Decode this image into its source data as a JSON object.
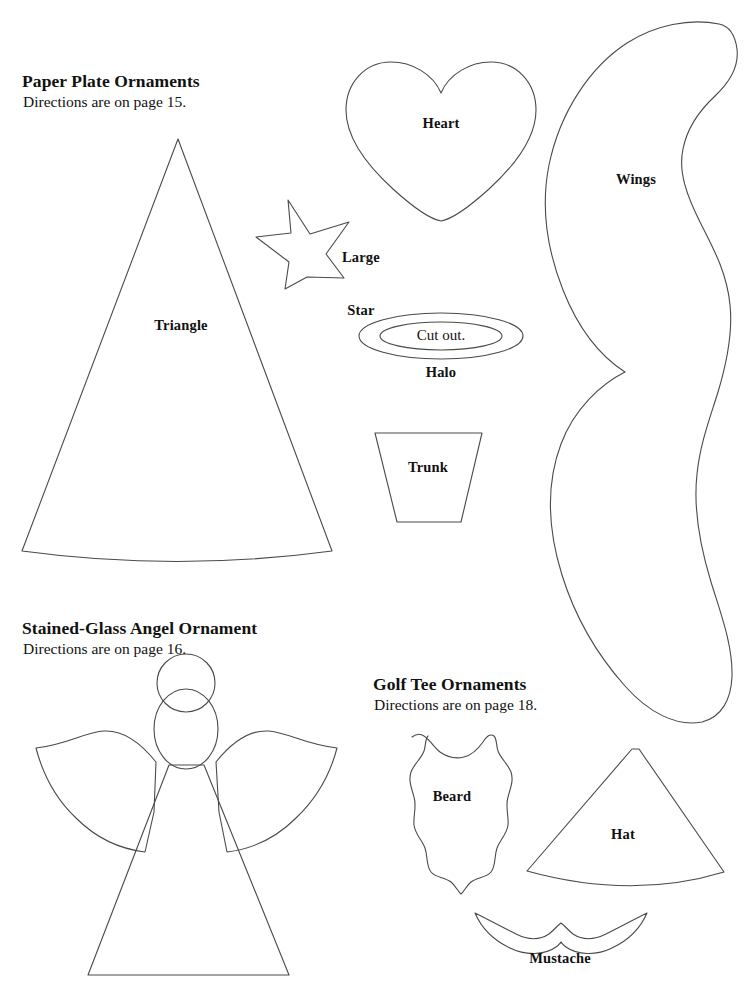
{
  "page": {
    "background_color": "#ffffff",
    "ink_color": "#4a4a4a",
    "text_color": "#111111",
    "width": 745,
    "height": 984
  },
  "sections": [
    {
      "id": "paper-plate-ornaments",
      "title": "Paper Plate Ornaments",
      "subtitle": "Directions are on page 15."
    },
    {
      "id": "stained-glass-angel-ornament",
      "title": "Stained-Glass Angel Ornament",
      "subtitle": "Directions are on page 16."
    },
    {
      "id": "golf-tee-ornaments",
      "title": "Golf Tee Ornaments",
      "subtitle": "Directions are on page 18."
    }
  ],
  "shapes": {
    "triangle": {
      "label": "Triangle"
    },
    "heart": {
      "label": "Heart"
    },
    "large_star": {
      "label_line1": "Large",
      "label_line2": "Star"
    },
    "wings": {
      "label": "Wings"
    },
    "halo": {
      "label": "Halo",
      "inner_label": "Cut out."
    },
    "trunk": {
      "label": "Trunk"
    },
    "beard": {
      "label": "Beard"
    },
    "hat": {
      "label": "Hat"
    },
    "mustache": {
      "label": "Mustache"
    },
    "angel": {
      "label": ""
    }
  }
}
